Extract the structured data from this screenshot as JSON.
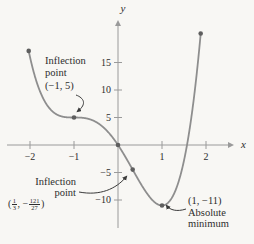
{
  "figure": {
    "background": "#f8f7f4",
    "curve_color": "#8e8e8e",
    "axis_color": "#9a9a9a",
    "dot_color": "#5e5e5e",
    "arrow_color": "#3a3a3a",
    "text_color": "#2d2d2d"
  },
  "axes": {
    "x_label": "x",
    "y_label": "y"
  },
  "annotations": {
    "inflection1": {
      "line1": "Inflection",
      "line2": "point",
      "coords": "(−1, 5)"
    },
    "inflection2": {
      "line1": "Inflection",
      "line2": "point",
      "coords": {
        "open": "(",
        "frac1_num": "1",
        "frac1_den": "3",
        "sep": ", −",
        "frac2_num": "121",
        "frac2_den": "27",
        "close": ")"
      }
    },
    "minimum": {
      "coords": "(1, −11)",
      "line2": "Absolute",
      "line3": "minimum"
    }
  },
  "chart_data": {
    "type": "line",
    "function": "y = 3x⁴ + 4x³ − 6x² − 12x",
    "coefficients": {
      "x4": 3,
      "x3": 4,
      "x2": -6,
      "x1": -12,
      "x0": 0
    },
    "domain": [
      -2.03,
      1.88
    ],
    "x_ticks": [
      -2,
      -1,
      1,
      2
    ],
    "y_ticks": [
      15,
      10,
      5,
      -5,
      -10
    ],
    "xlabel": "x",
    "ylabel": "y",
    "xlim": [
      -2.55,
      3.0
    ],
    "ylim": [
      -18,
      22.7
    ],
    "grid": false,
    "key_points": [
      {
        "x": -2.03,
        "y": 17.11,
        "label": "curve left endpoint"
      },
      {
        "x": -1,
        "y": 5,
        "label": "Inflection point (−1, 5)"
      },
      {
        "x": 0,
        "y": 0,
        "label": "origin intercept"
      },
      {
        "x": 0.3333,
        "y": -4.481,
        "label": "Inflection point (1/3, −121/27)"
      },
      {
        "x": 1,
        "y": -11,
        "label": "Absolute minimum (1, −11)"
      },
      {
        "x": 1.88,
        "y": 20.28,
        "label": "curve right endpoint"
      }
    ]
  }
}
